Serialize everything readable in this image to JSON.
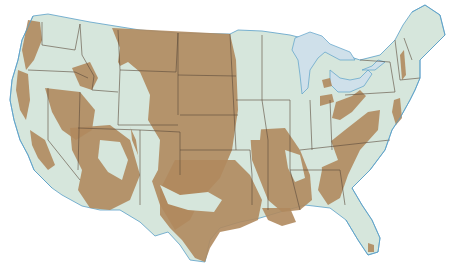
{
  "map": {
    "type": "thematic",
    "subject": "United States (contiguous) — shaded regions",
    "colors": {
      "land": "#d6e6dc",
      "shaded_region": "#b08a5e",
      "water": "#cfe0ea",
      "coast": "#5aa0c8",
      "state_border": "#5a4a3a",
      "background": "#ffffff"
    },
    "legend": {
      "shaded_region": "tan/brown areas",
      "unshaded": "pale green areas"
    }
  },
  "caption": {
    "text": ""
  }
}
